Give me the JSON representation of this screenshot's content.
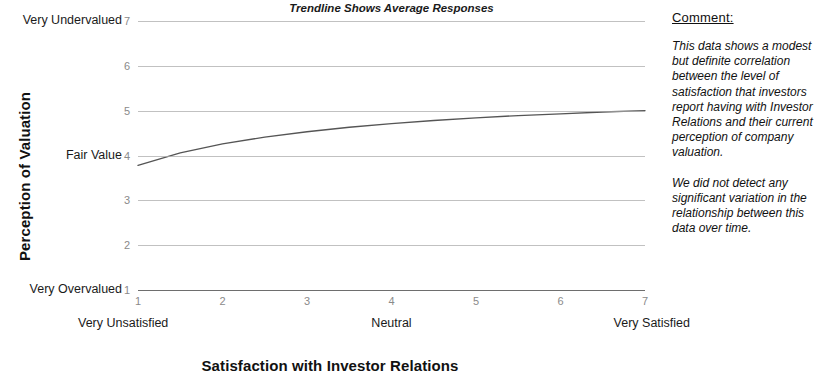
{
  "chart_data": {
    "type": "line",
    "title": "Trendline Shows Average Responses",
    "xlabel": "Satisfaction with Investor Relations",
    "ylabel": "Perception of Valuation",
    "xlim": [
      1,
      7
    ],
    "ylim": [
      1,
      7
    ],
    "grid": true,
    "legend": "none",
    "x_ticks": [
      "1",
      "2",
      "3",
      "4",
      "5",
      "6",
      "7"
    ],
    "y_ticks": [
      "1",
      "2",
      "3",
      "4",
      "5",
      "6",
      "7"
    ],
    "x_category_labels": [
      {
        "at": 1,
        "label": "Very Unsatisfied"
      },
      {
        "at": 4,
        "label": "Neutral"
      },
      {
        "at": 7,
        "label": "Very Satisfied"
      }
    ],
    "y_category_labels": [
      {
        "at": 7,
        "label": "Very Undervalued"
      },
      {
        "at": 4,
        "label": "Fair Value"
      },
      {
        "at": 1,
        "label": "Very Overvalued"
      }
    ],
    "series": [
      {
        "name": "Trendline (average responses)",
        "color": "#555555",
        "x": [
          1,
          1.5,
          2,
          2.5,
          3,
          3.5,
          4,
          4.5,
          5,
          5.5,
          6,
          6.5,
          7
        ],
        "values": [
          3.78,
          4.06,
          4.26,
          4.41,
          4.53,
          4.63,
          4.71,
          4.78,
          4.84,
          4.89,
          4.93,
          4.97,
          5.0
        ]
      }
    ]
  },
  "comment": {
    "heading": "Comment:",
    "paragraphs": [
      "This data shows a modest but definite correlation between the level of satisfaction that investors report having with Investor Relations and their current perception of company valuation.",
      "We did not detect any significant variation in the relationship between this data over time."
    ]
  },
  "colors": {
    "trendline": "#555555",
    "gridline": "#a9a9a9",
    "axis": "#6e6e6e",
    "tick_text": "#8a8a8a",
    "text": "#111111"
  }
}
